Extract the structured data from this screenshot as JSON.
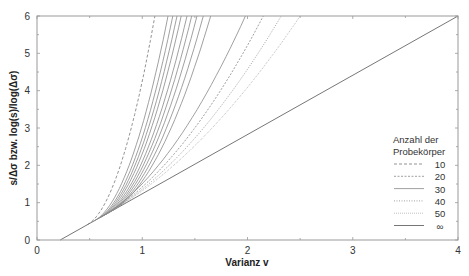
{
  "chart_data": {
    "type": "line",
    "title": "",
    "xlabel": "Varianz v",
    "ylabel": "s/Δσ bzw. log(s)/log(Δσ)",
    "xlim": [
      0,
      4
    ],
    "ylim": [
      0,
      6
    ],
    "xticks": [
      "0",
      "1",
      "2",
      "3",
      "4"
    ],
    "yticks": [
      "0",
      "1",
      "2",
      "3",
      "4",
      "5",
      "6"
    ],
    "grid": false,
    "legend": {
      "title_line1": "Anzahl der",
      "title_line2": "Probekörper",
      "position": "right-inside",
      "entries": [
        {
          "label": "10",
          "style": "dashed"
        },
        {
          "label": "20",
          "style": "dashed-fine"
        },
        {
          "label": "30",
          "style": "solid-thin"
        },
        {
          "label": "40",
          "style": "dotted"
        },
        {
          "label": "50",
          "style": "dotted-fine"
        },
        {
          "label": "∞",
          "style": "solid"
        }
      ]
    },
    "series": [
      {
        "name": "∞",
        "style": "solid",
        "points": [
          [
            0.22,
            0
          ],
          [
            4.0,
            6
          ]
        ]
      },
      {
        "name": "10",
        "style": "dashed",
        "v_start": 0.48,
        "v_top": 1.12
      },
      {
        "name": "30",
        "style": "solid-thin",
        "v_start": 0.55,
        "v_top": 1.245
      },
      {
        "name": "30",
        "style": "solid-thin",
        "v_start": 0.58,
        "v_top": 1.29
      },
      {
        "name": "30",
        "style": "solid-thin",
        "v_start": 0.6,
        "v_top": 1.33
      },
      {
        "name": "30",
        "style": "solid-thin",
        "v_start": 0.62,
        "v_top": 1.37
      },
      {
        "name": "30",
        "style": "solid-thin",
        "v_start": 0.64,
        "v_top": 1.425
      },
      {
        "name": "30",
        "style": "solid-thin",
        "v_start": 0.66,
        "v_top": 1.47
      },
      {
        "name": "30",
        "style": "solid-thin",
        "v_start": 0.68,
        "v_top": 1.52
      },
      {
        "name": "30",
        "style": "solid-thin",
        "v_start": 0.7,
        "v_top": 1.58
      },
      {
        "name": "30",
        "style": "solid-thin",
        "v_start": 0.72,
        "v_top": 1.65
      },
      {
        "name": "20",
        "style": "solid-thin",
        "v_start": 0.6,
        "v_top": 1.98
      },
      {
        "name": "40",
        "style": "dashed-fine",
        "v_start": 0.62,
        "v_top": 2.15
      },
      {
        "name": "50",
        "style": "dotted",
        "v_start": 0.64,
        "v_top": 2.32
      },
      {
        "name": "20",
        "style": "dotted-fine",
        "v_start": 0.66,
        "v_top": 2.5
      }
    ]
  }
}
